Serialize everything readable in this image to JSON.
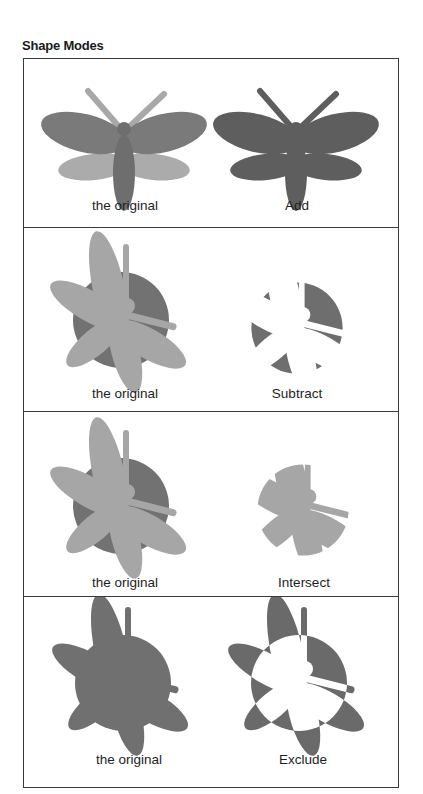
{
  "title": "Shape Modes",
  "colors": {
    "dark_gray": "#666666",
    "mid_gray": "#808080",
    "light_gray": "#a8a8a8",
    "border": "#3a3a3a",
    "background": "#ffffff"
  },
  "panels": [
    {
      "original_label": "the original",
      "result_label": "Add",
      "mode": "add",
      "subject": "moth"
    },
    {
      "original_label": "the original",
      "result_label": "Subtract",
      "mode": "subtract",
      "subject": "dragonfly-over-circle"
    },
    {
      "original_label": "the original",
      "result_label": "Intersect",
      "mode": "intersect",
      "subject": "dragonfly-over-circle"
    },
    {
      "original_label": "the original",
      "result_label": "Exclude",
      "mode": "exclude",
      "subject": "dragonfly-over-circle"
    }
  ]
}
